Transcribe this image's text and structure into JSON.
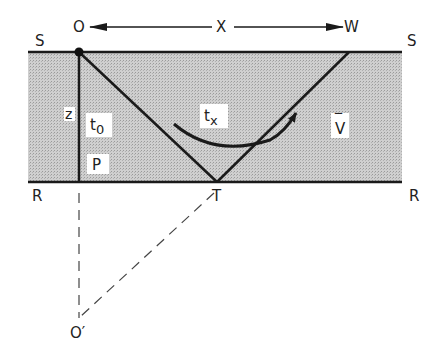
{
  "diagram": {
    "labels": {
      "origin": "O",
      "offset": "X",
      "receiver": "W",
      "surface_left": "S",
      "surface_right": "S",
      "reflector_left": "R",
      "reflector_right": "R",
      "depth": "z",
      "zero_offset_time": "t",
      "zero_offset_sub": "0",
      "normal_point": "P",
      "reflection_point": "T",
      "offset_time": "t",
      "offset_time_sub": "x",
      "velocity": "V",
      "velocity_bar": "‾",
      "image_source": "O′"
    },
    "colors": {
      "layer_fill": "#c4c4c4",
      "line": "#1a1a1a",
      "dashed": "#444444",
      "label_box": "#ffffff"
    }
  }
}
